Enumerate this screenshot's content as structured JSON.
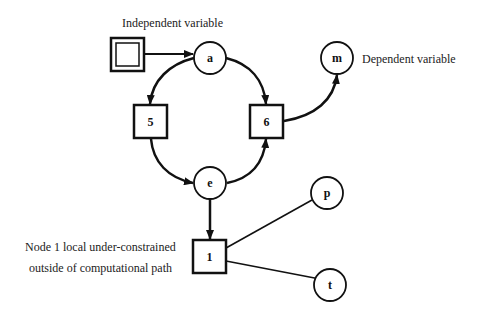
{
  "diagram": {
    "annotations": {
      "independent": "Independent variable",
      "dependent": "Dependent variable",
      "node1_line1": "Node 1 local under-constrained",
      "node1_line2": "outside of computational path"
    },
    "nodes": {
      "source": {
        "label": "",
        "shape": "double-square"
      },
      "a": {
        "label": "a",
        "shape": "circle"
      },
      "n5": {
        "label": "5",
        "shape": "square"
      },
      "n6": {
        "label": "6",
        "shape": "square"
      },
      "e": {
        "label": "e",
        "shape": "circle"
      },
      "m": {
        "label": "m",
        "shape": "circle"
      },
      "n1": {
        "label": "1",
        "shape": "square"
      },
      "p": {
        "label": "p",
        "shape": "circle"
      },
      "t": {
        "label": "t",
        "shape": "circle"
      }
    },
    "edges": [
      {
        "from": "source",
        "to": "a",
        "directed": true
      },
      {
        "from": "a",
        "to": "5",
        "directed": true
      },
      {
        "from": "a",
        "to": "6",
        "directed": true
      },
      {
        "from": "5",
        "to": "e",
        "directed": true
      },
      {
        "from": "e",
        "to": "6",
        "directed": true
      },
      {
        "from": "6",
        "to": "m",
        "directed": true
      },
      {
        "from": "e",
        "to": "1",
        "directed": true
      },
      {
        "from": "1",
        "to": "p",
        "directed": false
      },
      {
        "from": "1",
        "to": "t",
        "directed": false
      }
    ],
    "colors": {
      "stroke": "#111111",
      "background": "#ffffff"
    }
  }
}
